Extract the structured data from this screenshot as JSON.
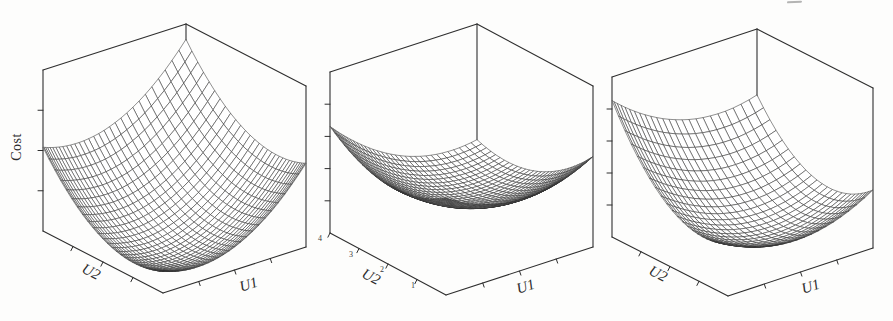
{
  "figure": {
    "kind": "three 3D wireframe cost-surface plots",
    "panels": [
      {
        "id": "left",
        "zlabel": "Cost",
        "xlabel": "U1",
        "ylabel": "U2"
      },
      {
        "id": "middle",
        "xlabel": "U1",
        "ylabel": "U2",
        "y_tick_labels": [
          "1",
          "2",
          "3",
          "4"
        ]
      },
      {
        "id": "right",
        "xlabel": "U1",
        "ylabel": "U2"
      }
    ]
  },
  "chart_data": [
    {
      "type": "surface",
      "title": "",
      "xlabel": "U1",
      "ylabel": "U2",
      "zlabel": "Cost",
      "grid_lines": 30,
      "grid_power": 1.5,
      "x_axis_ticks": 3,
      "y_axis_ticks": 3,
      "z_axis_ticks": 3,
      "normalized_range": {
        "u": [
          0,
          1
        ],
        "v": [
          0,
          1
        ],
        "z": [
          0,
          1
        ]
      },
      "surface_model": {
        "form": "quadratic",
        "c": 0.05,
        "A": 0.74,
        "B": 0.74,
        "C": 0,
        "u0": 0.24,
        "v0": 0.24
      },
      "corner_heights_normalized": {
        "front": 0.14,
        "left": 0.52,
        "right": 0.52,
        "back": 0.9
      },
      "shape_note": "deep symmetric bowl, minimum near front corner"
    },
    {
      "type": "surface",
      "title": "",
      "xlabel": "U1",
      "ylabel": "U2",
      "zlabel": "",
      "grid_lines": 34,
      "grid_power": 1.4,
      "x_axis_ticks": 3,
      "y_axis_ticks": 4,
      "z_axis_ticks": 4,
      "y_tick_labels": [
        "1",
        "2",
        "3",
        "4"
      ],
      "y_tick_values": [
        1,
        2,
        3,
        4
      ],
      "normalized_range": {
        "u": [
          0,
          1
        ],
        "v": [
          0,
          4
        ],
        "z": [
          0,
          1
        ]
      },
      "surface_model": {
        "form": "valley",
        "c": 0.21,
        "s0": 0.7,
        "a_diag": 0.8,
        "a_cross": 0.37,
        "tilt": 0.05
      },
      "corner_heights_normalized": {
        "front": 0.6,
        "left": 0.66,
        "right": 0.56,
        "back": 0.28
      },
      "shape_note": "shallow hammock sagging mid-box, diagonal valley"
    },
    {
      "type": "surface",
      "title": "",
      "xlabel": "U1",
      "ylabel": "U2",
      "zlabel": "",
      "grid_lines": 24,
      "grid_power": 1.35,
      "x_axis_ticks": 3,
      "y_axis_ticks": 3,
      "z_axis_ticks": 4,
      "normalized_range": {
        "u": [
          0,
          1
        ],
        "v": [
          0,
          1
        ],
        "z": [
          0,
          1
        ]
      },
      "surface_model": {
        "form": "quadratic",
        "c": 0.13,
        "A": 0.55,
        "B": 0.9,
        "C": -0.3,
        "u0": 0.55,
        "v0": 0.3
      },
      "corner_heights_normalized": {
        "front": 0.33,
        "left": 0.85,
        "right": 0.36,
        "back": 0.59
      },
      "shape_note": "asymmetric bowl, high on left, trough toward front-right"
    }
  ]
}
